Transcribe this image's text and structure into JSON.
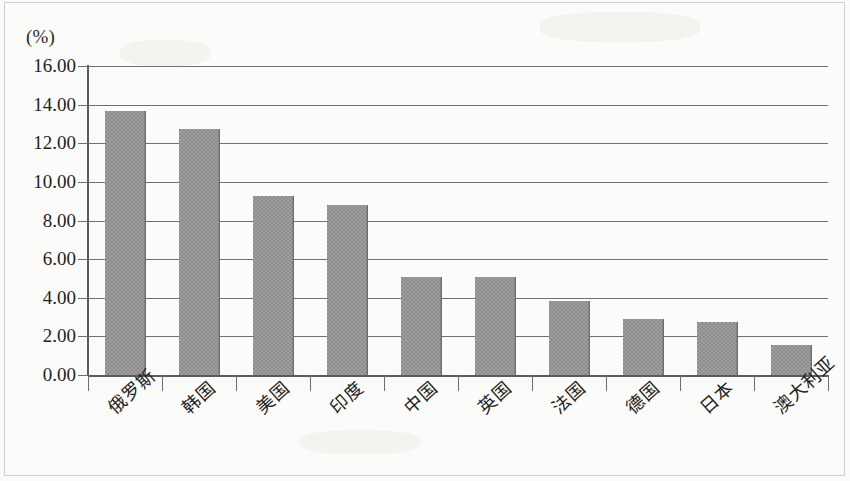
{
  "chart_data": {
    "type": "bar",
    "title": "",
    "xlabel": "",
    "ylabel": "(%)",
    "unit_label": "(%)",
    "ylim": [
      0,
      16
    ],
    "ytick_step": 2,
    "ytick_labels": [
      "16.00",
      "14.00",
      "12.00",
      "10.00",
      "8.00",
      "6.00",
      "4.00",
      "2.00",
      "0.00"
    ],
    "ytick_values": [
      16,
      14,
      12,
      10,
      8,
      6,
      4,
      2,
      0
    ],
    "grid": true,
    "legend": "none",
    "categories": [
      "俄罗斯",
      "韩国",
      "美国",
      "印度",
      "中国",
      "英国",
      "法国",
      "德国",
      "日本",
      "澳大利亚"
    ],
    "values": [
      13.65,
      12.75,
      9.25,
      8.8,
      5.1,
      5.1,
      3.82,
      2.9,
      2.75,
      1.55
    ],
    "bar_color": "#8c8c8c",
    "axis_color": "#5b5b5b",
    "grid_color": "#6f6f6f"
  }
}
